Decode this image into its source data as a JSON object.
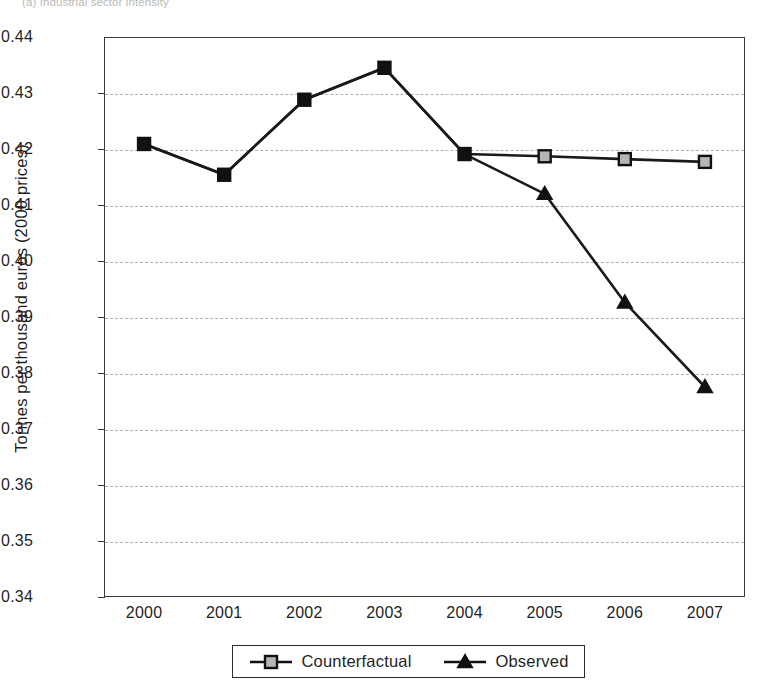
{
  "figure": {
    "caption": "(a) Industrial sector intensity"
  },
  "legend": {
    "items": [
      {
        "label": "Counterfactual",
        "marker": "square-marker"
      },
      {
        "label": "Observed",
        "marker": "triangle-marker"
      }
    ]
  },
  "chart_data": {
    "type": "line",
    "title": "(a) Industrial sector intensity",
    "xlabel": "",
    "ylabel": "Tonnes per thousand euros (2000 prices)",
    "categories": [
      "2000",
      "2001",
      "2002",
      "2003",
      "2004",
      "2005",
      "2006",
      "2007"
    ],
    "x": [
      2000,
      2001,
      2002,
      2003,
      2004,
      2005,
      2006,
      2007
    ],
    "series": [
      {
        "name": "Counterfactual",
        "marker": "square",
        "values": [
          0.4209,
          0.4154,
          0.4288,
          0.4345,
          0.4191,
          0.4187,
          0.4182,
          0.4177
        ]
      },
      {
        "name": "Observed",
        "marker": "triangle",
        "values": [
          0.4209,
          0.4154,
          0.4288,
          0.4345,
          0.4191,
          0.412,
          0.3926,
          0.3775
        ]
      }
    ],
    "ylim": [
      0.34,
      0.44
    ],
    "yticks": [
      0.34,
      0.35,
      0.36,
      0.37,
      0.38,
      0.39,
      0.4,
      0.41,
      0.42,
      0.43,
      0.44
    ],
    "ytick_labels": [
      "0.34",
      "0.35",
      "0.36",
      "0.37",
      "0.38",
      "0.39",
      "0.40",
      "0.41",
      "0.42",
      "0.43",
      "0.44"
    ],
    "grid": true,
    "grid_style": "dashed-horizontal",
    "legend_position": "below-axes",
    "line_color": "#1a1a1a",
    "grid_color": "#b0b0b0"
  }
}
